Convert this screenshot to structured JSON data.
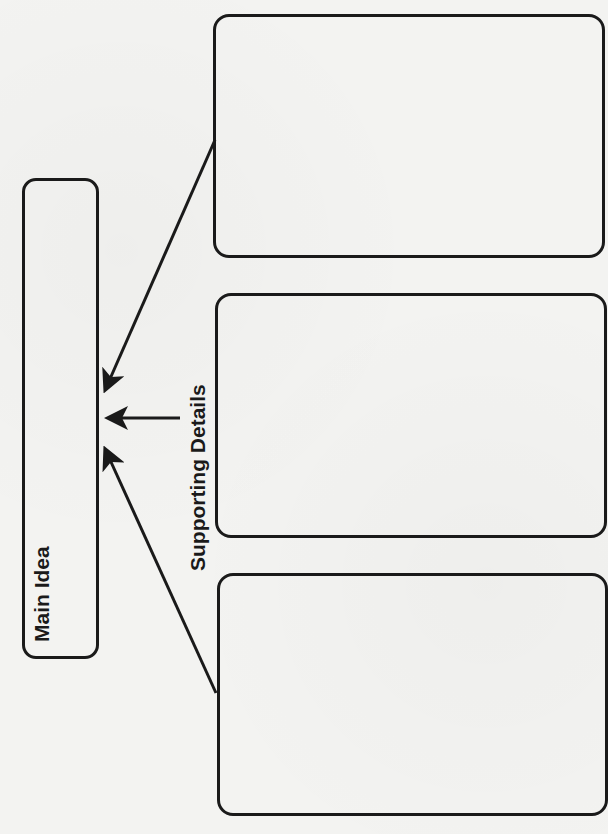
{
  "diagram": {
    "type": "graphic-organizer",
    "main_idea": {
      "label": "Main Idea"
    },
    "supporting": {
      "label": "Supporting Details"
    },
    "detail_boxes": [
      {
        "content": ""
      },
      {
        "content": ""
      },
      {
        "content": ""
      }
    ],
    "arrows": [
      {
        "from": "detail-box-1",
        "to": "main-idea-box"
      },
      {
        "from": "supporting-details-label",
        "to": "main-idea-box"
      },
      {
        "from": "detail-box-3",
        "to": "main-idea-box"
      }
    ],
    "colors": {
      "stroke": "#1a1a1a",
      "background": "#f3f3f1"
    }
  }
}
